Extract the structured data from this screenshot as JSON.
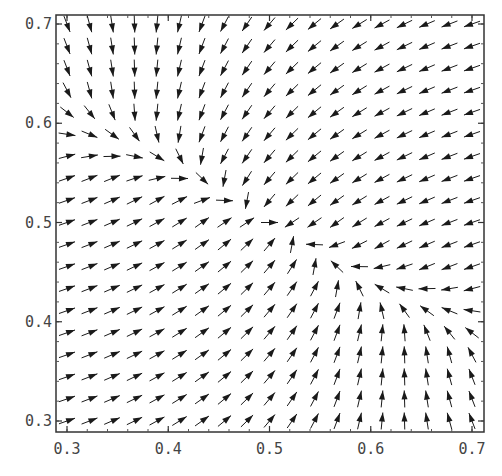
{
  "chart_data": {
    "type": "vector_field",
    "title": "",
    "xlabel": "",
    "ylabel": "",
    "xlim": [
      0.3,
      0.7
    ],
    "ylim": [
      0.3,
      0.7
    ],
    "x_ticks": [
      0.3,
      0.4,
      0.5,
      0.6,
      0.7
    ],
    "y_ticks": [
      0.3,
      0.4,
      0.5,
      0.6,
      0.7
    ],
    "x_tick_labels": [
      "0.3",
      "0.4",
      "0.5",
      "0.6",
      "0.7"
    ],
    "y_tick_labels": [
      "0.3",
      "0.4",
      "0.5",
      "0.6",
      "0.7"
    ],
    "grid": false,
    "legend": null,
    "arrow_grid": {
      "nx": 19,
      "ny": 19,
      "x_start": 0.3,
      "x_end": 0.7,
      "y_start": 0.3,
      "y_end": 0.7
    },
    "fixed_point": [
      0.5,
      0.5
    ],
    "attracting_curve": {
      "description": "Flow converges onto a curve from (0.3, 0.6) through (0.5, 0.5) to (0.7, 0.4), then moves along it toward (0.5, 0.5)",
      "points": [
        [
          0.3,
          0.6
        ],
        [
          0.4,
          0.56
        ],
        [
          0.5,
          0.5
        ],
        [
          0.6,
          0.44
        ],
        [
          0.7,
          0.4
        ]
      ]
    },
    "flow_summary": {
      "upper_right": "arrows point down-left",
      "lower_left": "arrows point up-right",
      "upper_left": "arrows point downward",
      "lower_right": "arrows point upward",
      "on_curve_left": "arrows point right",
      "on_curve_right": "arrows point left"
    },
    "arrow_color": "#1a1a1a",
    "axis_color": "#333333"
  },
  "axes": {
    "frame": {
      "left": 56,
      "top": 15,
      "right": 484,
      "bottom": 432
    },
    "data_px": {
      "x0": 67,
      "x1": 472,
      "y0": 421,
      "y1": 24
    }
  }
}
